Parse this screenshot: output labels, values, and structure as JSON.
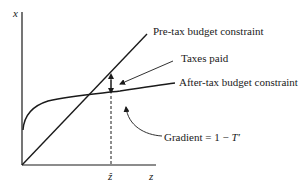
{
  "diagram": {
    "axes": {
      "y_label": "x",
      "x_label": "z",
      "marker_label": "ẑ"
    },
    "annotations": {
      "pre_tax": "Pre-tax budget constraint",
      "taxes_paid": "Taxes paid",
      "after_tax": "After-tax budget constraint",
      "gradient_prefix": "Gradient = 1 − ",
      "gradient_var": "T′"
    },
    "colors": {
      "ink": "#1a1a1a",
      "background": "#ffffff"
    }
  }
}
